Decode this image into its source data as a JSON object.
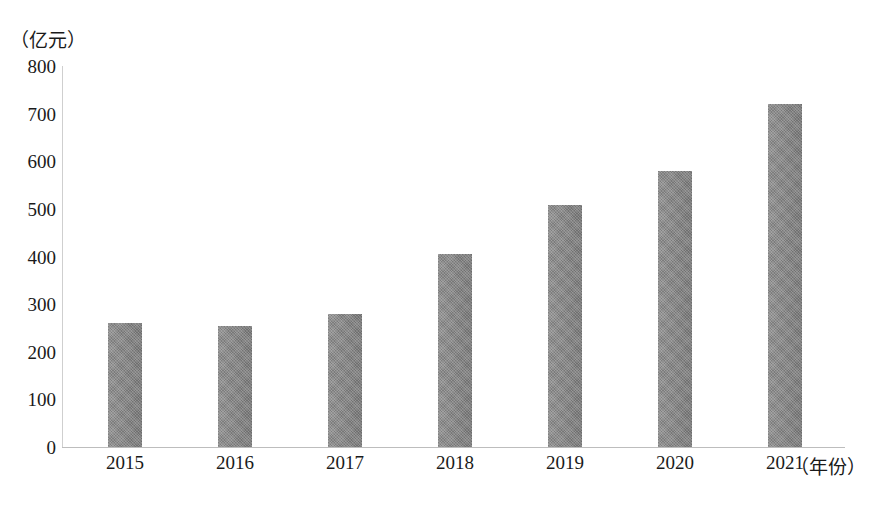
{
  "chart_data": {
    "type": "bar",
    "title": "",
    "subtitle": "",
    "unit_label": "（亿元）",
    "xlabel": "（年份）",
    "ylabel": "",
    "categories": [
      "2015",
      "2016",
      "2017",
      "2018",
      "2019",
      "2020",
      "2021"
    ],
    "values": [
      260,
      254,
      280,
      405,
      508,
      580,
      720
    ],
    "series": [
      {
        "name": "",
        "values": [
          260,
          254,
          280,
          405,
          508,
          580,
          720
        ]
      }
    ],
    "ylim": [
      0,
      800
    ],
    "yticks": [
      0,
      100,
      200,
      300,
      400,
      500,
      600,
      700,
      800
    ],
    "ytick_labels": [
      "0",
      "100",
      "200",
      "300",
      "400",
      "500",
      "600",
      "700",
      "800"
    ],
    "grid": false,
    "legend": "none",
    "bar_color": "#858585",
    "axis_color": "#c4c4c4",
    "text_color": "#1a1a1a",
    "background": "#ffffff"
  }
}
